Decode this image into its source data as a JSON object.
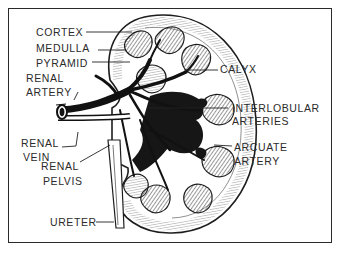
{
  "diagram": {
    "colors": {
      "ink": "#1e1e1e",
      "label": "#2b2b2b",
      "background": "#ffffff"
    },
    "labels": {
      "cortex": "CORTEX",
      "medulla": "MEDULLA",
      "pyramid": "PYRAMID",
      "renal_artery_1": "RENAL",
      "renal_artery_2": "ARTERY",
      "calyx": "CALYX",
      "interlobular_1": "INTERLOBULAR",
      "interlobular_2": "ARTERIES",
      "renal_vein_1": "RENAL",
      "renal_vein_2": "VEIN",
      "renal_pelvis_1": "RENAL",
      "renal_pelvis_2": "PELVIS",
      "arcuate_1": "ARCUATE",
      "arcuate_2": "ARTERY",
      "ureter": "URETER"
    }
  }
}
